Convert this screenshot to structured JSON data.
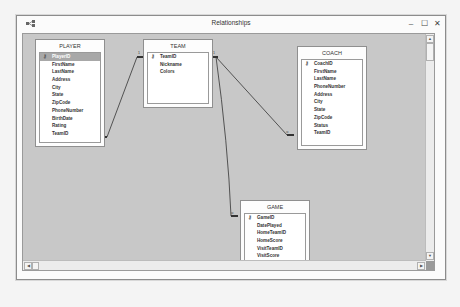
{
  "window": {
    "title": "Relationships",
    "icons": {
      "app": "relationships-app-icon",
      "minimize": "–",
      "maximize": "☐",
      "close": "✕"
    }
  },
  "tables": [
    {
      "name": "PLAYER",
      "fields": [
        "PlayerID",
        "FirstName",
        "LastName",
        "Address",
        "City",
        "State",
        "ZipCode",
        "PhoneNumber",
        "BirthDate",
        "Rating",
        "TeamID"
      ],
      "primary_key": "PlayerID",
      "selected_field": "PlayerID"
    },
    {
      "name": "TEAM",
      "fields": [
        "TeamID",
        "Nickname",
        "Colors"
      ],
      "primary_key": "TeamID"
    },
    {
      "name": "COACH",
      "fields": [
        "CoachID",
        "FirstName",
        "LastName",
        "PhoneNumber",
        "Address",
        "City",
        "State",
        "ZipCode",
        "Status",
        "TeamID"
      ],
      "primary_key": "CoachID"
    },
    {
      "name": "GAME",
      "fields": [
        "GameID",
        "DatePlayed",
        "HomeTeamID",
        "HomeScore",
        "VisitTeamID",
        "VisitScore"
      ],
      "primary_key": "GameID"
    }
  ],
  "relationships": [
    {
      "from": "TEAM.TeamID",
      "to": "PLAYER.TeamID",
      "one_label": "1",
      "many_label": "∞"
    },
    {
      "from": "TEAM.TeamID",
      "to": "COACH.TeamID",
      "one_label": "1",
      "many_label": "∞"
    },
    {
      "from": "TEAM.TeamID",
      "to": "GAME.HomeTeamID",
      "one_label": "1",
      "many_label": "∞"
    }
  ],
  "scrollbars": {
    "up": "▲",
    "down": "▼",
    "left": "◀",
    "right": "▶"
  }
}
